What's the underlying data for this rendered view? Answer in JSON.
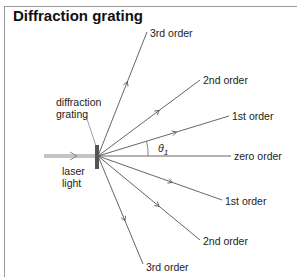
{
  "title": "Diffraction grating",
  "labels": {
    "grating": [
      "diffraction",
      "grating"
    ],
    "laser": [
      "laser",
      "light"
    ],
    "theta": "θ",
    "theta_sub": "1"
  },
  "orders": [
    {
      "name": "3rd order",
      "end": [
        147,
        32
      ],
      "label_pos": [
        150,
        37
      ]
    },
    {
      "name": "2nd order",
      "end": [
        200,
        80
      ],
      "label_pos": [
        203,
        84
      ]
    },
    {
      "name": "1st order",
      "end": [
        229,
        116
      ],
      "label_pos": [
        232,
        120
      ]
    },
    {
      "name": "zero order",
      "end": [
        231,
        156
      ],
      "label_pos": [
        234,
        160
      ]
    },
    {
      "name": "1st order",
      "end": [
        222,
        200
      ],
      "label_pos": [
        225,
        205
      ]
    },
    {
      "name": "2nd order",
      "end": [
        200,
        240
      ],
      "label_pos": [
        203,
        245
      ]
    },
    {
      "name": "3rd order",
      "end": [
        143,
        264
      ],
      "label_pos": [
        146,
        271
      ]
    }
  ],
  "colors": {
    "line": "#555555",
    "grating": "#444444",
    "laser": "#bbbbbb"
  }
}
